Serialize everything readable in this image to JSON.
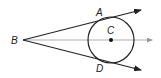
{
  "diagram": {
    "type": "geometry",
    "points": {
      "B": {
        "label": "B",
        "x": 23,
        "y": 40
      },
      "C": {
        "label": "C",
        "x": 111,
        "y": 40
      },
      "A": {
        "label": "A",
        "x": 99,
        "y": 20
      },
      "D": {
        "label": "D",
        "x": 99,
        "y": 60
      }
    },
    "circle": {
      "center": "C",
      "radius": 23
    },
    "rays": [
      {
        "from": "B",
        "through": "A",
        "style": "solid-arrow"
      },
      {
        "from": "B",
        "through": "D",
        "style": "solid-arrow"
      },
      {
        "from": "B",
        "through": "C",
        "style": "gray-arrow"
      }
    ],
    "colors": {
      "ink": "#222222",
      "axis": "#999999"
    }
  }
}
